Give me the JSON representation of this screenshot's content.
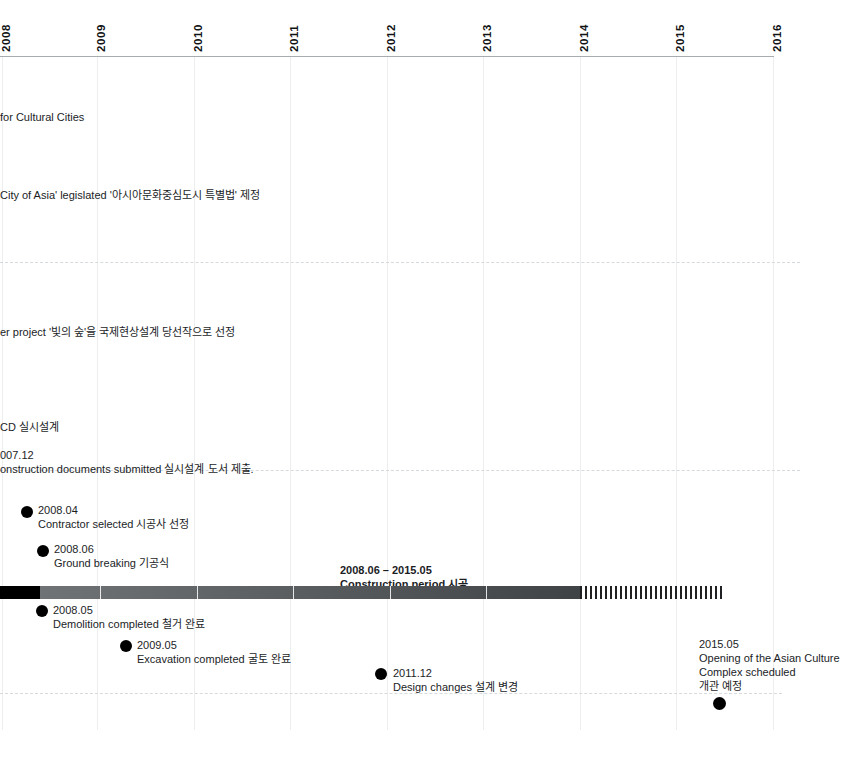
{
  "axis": {
    "name": "year-axis",
    "years": [
      "2008",
      "2009",
      "2010",
      "2011",
      "2012",
      "2013",
      "2014",
      "2015",
      "2016"
    ]
  },
  "events": [
    {
      "id": "cultural-cities",
      "lines": [
        "for Cultural Cities"
      ],
      "dot": false
    },
    {
      "id": "hub-city-of-asia-legislated",
      "lines": [
        "City of Asia' legislated   '아시아문화중심도시 특별법' 제정"
      ],
      "dot": false
    },
    {
      "id": "forest-of-light-winning-entry",
      "lines": [
        "er project  '빛의 숲'을 국제현상설계 당선작으로 선정"
      ],
      "dot": false
    },
    {
      "id": "cd-construction-design",
      "lines": [
        "CD 실시설계"
      ],
      "dot": false
    },
    {
      "id": "construction-documents-submitted",
      "lines": [
        "007.12",
        "onstruction documents submitted  실시설계 도서 제출."
      ],
      "dot": false
    },
    {
      "id": "contractor-selected",
      "lines": [
        "2008.04",
        "Contractor selected  시공사 선정"
      ],
      "dot": true
    },
    {
      "id": "ground-breaking",
      "lines": [
        "2008.06",
        "Ground breaking  기공식"
      ],
      "dot": true
    },
    {
      "id": "construction-period",
      "lines": [
        "2008.06 – 2015.05",
        "Construction period  시공"
      ],
      "dot": false
    },
    {
      "id": "demolition-completed",
      "lines": [
        "2008.05",
        "Demolition completed  철거 완료"
      ],
      "dot": true
    },
    {
      "id": "excavation-completed",
      "lines": [
        "2009.05",
        "Excavation completed  굴토 완료"
      ],
      "dot": true
    },
    {
      "id": "design-changes",
      "lines": [
        "2011.12",
        "Design changes  설계 변경"
      ],
      "dot": true
    },
    {
      "id": "opening-scheduled",
      "lines": [
        "2015.05",
        "Opening of the Asian Culture Complex scheduled",
        "개관 예정"
      ],
      "dot": true
    }
  ],
  "text": {
    "cultural_cities": "for Cultural Cities",
    "hub_city": "City of Asia' legislated   '아시아문화중심도시 특별법' 제정",
    "forest_of_light": "er project  '빛의 숲'을 국제현상설계 당선작으로 선정",
    "cd_design": "CD 실시설계",
    "cd_docs_date": "007.12",
    "cd_docs_desc": "onstruction documents submitted  실시설계 도서 제출.",
    "contractor_date": "2008.04",
    "contractor_desc": "Contractor selected  시공사 선정",
    "groundbreaking_date": "2008.06",
    "groundbreaking_desc": "Ground breaking  기공식",
    "construction_range": "2008.06 – 2015.05",
    "construction_desc": "Construction period  시공",
    "demolition_date": "2008.05",
    "demolition_desc": "Demolition completed  철거 완료",
    "excavation_date": "2009.05",
    "excavation_desc": "Excavation completed  굴토 완료",
    "design_change_date": "2011.12",
    "design_change_desc": "Design changes  설계 변경",
    "opening_date": "2015.05",
    "opening_desc_1": "Opening of the Asian Culture",
    "opening_desc_2": "Complex scheduled",
    "opening_desc_ko": "개관 예정"
  },
  "colors": {
    "bar_completed": "#4c5053",
    "bar_start": "#000000",
    "bar_planned_hatch": "#1f2123",
    "gridline": "#eceef0",
    "axis": "#a9acae",
    "separator": "#d7dadd",
    "dot": "#000000",
    "text": "#1b1d1f"
  }
}
